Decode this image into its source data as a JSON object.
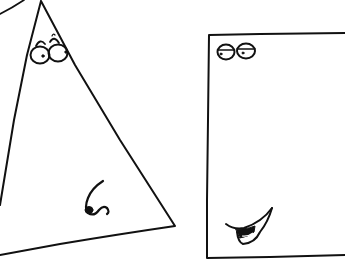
{
  "scene": {
    "description": "Hand-drawn cartoon of a triangle character and a rectangle character with faces",
    "background": "#ffffff",
    "ink_color": "#111111"
  },
  "characters": [
    {
      "name": "triangle",
      "features": [
        "raised-eyebrows",
        "round-glasses-eyes",
        "curly-nose"
      ]
    },
    {
      "name": "rectangle",
      "features": [
        "half-closed-round-eyes",
        "smirking-mouth"
      ]
    }
  ]
}
